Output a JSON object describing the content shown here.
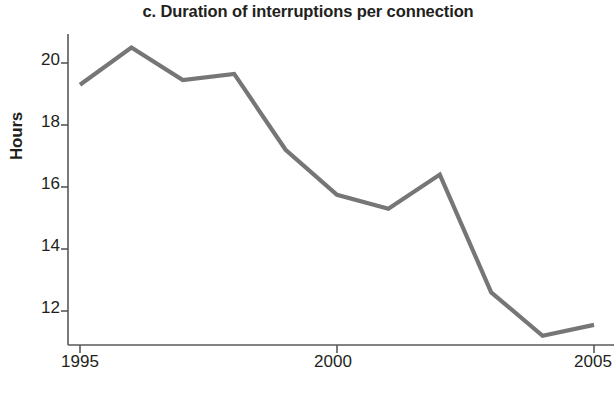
{
  "chart_data": {
    "type": "line",
    "title": "c. Duration of interruptions per connection",
    "xlabel": "Year",
    "ylabel": "Hours",
    "grid": false,
    "legend": "none",
    "x": [
      1995,
      1996,
      1997,
      1998,
      1999,
      2000,
      2001,
      2002,
      2003,
      2004,
      2005
    ],
    "values": [
      19.3,
      20.5,
      19.45,
      19.65,
      17.2,
      15.75,
      15.3,
      16.4,
      12.6,
      11.2,
      11.55
    ],
    "series": [
      {
        "name": "Duration of interruptions per connection",
        "values": [
          19.3,
          20.5,
          19.45,
          19.65,
          17.2,
          15.75,
          15.3,
          16.4,
          12.6,
          11.2,
          11.55
        ],
        "color": "#767676"
      }
    ],
    "xlim": [
      1995,
      2005
    ],
    "ylim": [
      10.9,
      21.0
    ],
    "xticks": [
      1995,
      2000,
      2005
    ],
    "xtick_labels": [
      "1995",
      "2000",
      "2005"
    ],
    "yticks": [
      12,
      14,
      16,
      18,
      20
    ],
    "ytick_labels": [
      "12",
      "14",
      "16",
      "18",
      "20"
    ],
    "axis_color": "#58595b",
    "line_color": "#767676"
  },
  "figure": {
    "title": "c. Duration of interruptions per connection",
    "y_axis_title": "Hours",
    "x_axis_title": "Year",
    "ytick_labels": [
      "20",
      "18",
      "16",
      "14",
      "12"
    ],
    "xtick_labels": [
      "1995",
      "2000",
      "2005"
    ]
  }
}
